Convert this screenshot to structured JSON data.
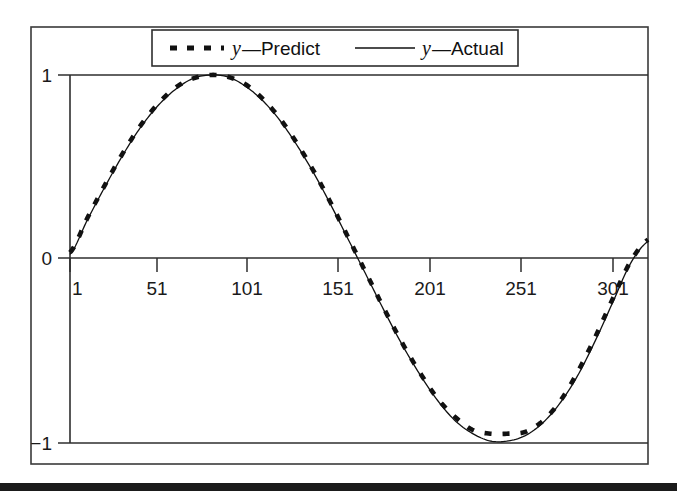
{
  "chart_data": {
    "type": "line",
    "title": "",
    "xlabel": "",
    "ylabel": "",
    "xlim": [
      1,
      331
    ],
    "ylim": [
      -1.08,
      1.08
    ],
    "grid": true,
    "gridlines_y": [
      1,
      -1
    ],
    "legend_position": "top-center",
    "x_ticks": [
      "1",
      "51",
      "101",
      "151",
      "201",
      "251",
      "301"
    ],
    "x_tick_values": [
      1,
      51,
      101,
      151,
      201,
      251,
      301
    ],
    "y_ticks": [
      "1",
      "0",
      "-1"
    ],
    "y_tick_values": [
      1,
      0,
      -1
    ],
    "x": [
      1,
      11,
      21,
      31,
      41,
      51,
      61,
      71,
      81,
      91,
      101,
      111,
      121,
      131,
      141,
      151,
      161,
      171,
      181,
      191,
      201,
      211,
      221,
      231,
      241,
      251,
      261,
      271,
      281,
      291,
      301,
      311,
      321,
      331
    ],
    "series": [
      {
        "name": "y-Predict",
        "style": "dashed",
        "color": "#111111",
        "values": [
          0.03,
          0.22,
          0.4,
          0.57,
          0.72,
          0.84,
          0.93,
          0.98,
          1.0,
          0.99,
          0.95,
          0.87,
          0.76,
          0.62,
          0.46,
          0.28,
          0.09,
          -0.1,
          -0.29,
          -0.47,
          -0.63,
          -0.77,
          -0.87,
          -0.94,
          -0.96,
          -0.96,
          -0.95,
          -0.89,
          -0.78,
          -0.62,
          -0.43,
          -0.22,
          -0.02,
          0.1
        ]
      },
      {
        "name": "y-Actual",
        "style": "solid",
        "color": "#111111",
        "values": [
          0.02,
          0.21,
          0.39,
          0.56,
          0.71,
          0.83,
          0.92,
          0.98,
          1.0,
          0.99,
          0.94,
          0.86,
          0.75,
          0.61,
          0.45,
          0.27,
          0.08,
          -0.11,
          -0.3,
          -0.48,
          -0.64,
          -0.78,
          -0.89,
          -0.96,
          -1.0,
          -1.0,
          -0.97,
          -0.9,
          -0.79,
          -0.64,
          -0.45,
          -0.24,
          -0.03,
          0.09
        ]
      }
    ]
  },
  "legend": {
    "entries": [
      {
        "id": "predict",
        "swatch": "dashed",
        "variable": "y",
        "dash": "—",
        "label": "Predict"
      },
      {
        "id": "actual",
        "swatch": "solid",
        "variable": "y",
        "dash": "—",
        "label": "Actual"
      }
    ]
  },
  "axis_labels": {
    "x0": "1",
    "x1": "51",
    "x2": "101",
    "x3": "151",
    "x4": "201",
    "x5": "251",
    "x6": "301",
    "y_top": "1",
    "y_mid": "0",
    "y_bot": "−1"
  }
}
